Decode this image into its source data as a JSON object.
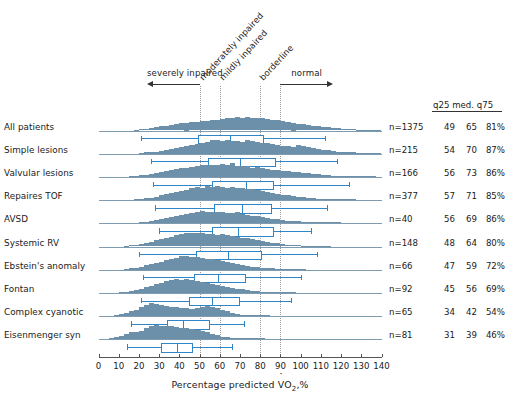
{
  "chart_data": {
    "type": "bar",
    "title": "",
    "xlabel": "Percentage predicted VO2,%",
    "xlabel_parts": {
      "pre": "Percentage predicted ",
      "v": "V",
      "o": "O",
      "sub": "2",
      "post": ",%"
    },
    "ylabel": "",
    "xlim": [
      0,
      140
    ],
    "xticks": [
      0,
      10,
      20,
      30,
      40,
      50,
      60,
      70,
      80,
      90,
      100,
      110,
      120,
      130,
      140
    ],
    "grid": true,
    "gridlines_x": [
      50,
      60,
      80,
      90
    ],
    "bin_width": 2.5,
    "legend_position": "none",
    "colors": {
      "histogram_fill": "#6d90aa",
      "baseline": "#7e9bb0",
      "boxwhisker": "#2e86c8",
      "gridline": "#9a9a9a",
      "axis": "#555555",
      "text": "#1a1a1a"
    },
    "annotations": [
      {
        "label": "severely inpaired",
        "kind": "arrow-left",
        "x_from": 50,
        "x_to": 24
      },
      {
        "label": "moderately inpaired",
        "kind": "rotated",
        "x": 50
      },
      {
        "label": "mildly inpaired",
        "kind": "rotated",
        "x": 60
      },
      {
        "label": "borderline",
        "kind": "rotated",
        "x": 80
      },
      {
        "label": "normal",
        "kind": "arrow-right",
        "x_from": 90,
        "x_to": 116
      }
    ],
    "stats_header": {
      "q25": "q25",
      "med": "med.",
      "q75": "q75"
    },
    "series": [
      {
        "name": "All patients",
        "n_label": "n=1375",
        "q25": "49",
        "med": "65",
        "q75": "81%",
        "box": {
          "lo": 21,
          "q1": 49,
          "med": 65,
          "q3": 81,
          "hi": 112
        },
        "values": [
          0,
          0,
          0,
          0,
          0,
          0,
          0,
          0.06,
          0.08,
          0.1,
          0.14,
          0.2,
          0.26,
          0.3,
          0.34,
          0.4,
          0.46,
          0.5,
          0.52,
          0.56,
          0.6,
          0.62,
          0.66,
          0.7,
          0.76,
          0.82,
          0.78,
          0.84,
          0.8,
          0.86,
          0.82,
          0.8,
          0.78,
          0.74,
          0.7,
          0.66,
          0.6,
          0.56,
          0.5,
          0.44,
          0.4,
          0.34,
          0.3,
          0.26,
          0.22,
          0.2,
          0.16,
          0.14,
          0.12,
          0.1,
          0.08,
          0.06,
          0.05,
          0.04,
          0.03,
          0.02
        ]
      },
      {
        "name": "Simple lesions",
        "n_label": "n=215",
        "q25": "54",
        "med": "70",
        "q75": "87%",
        "box": {
          "lo": 26,
          "q1": 54,
          "med": 70,
          "q3": 87,
          "hi": 118
        },
        "values": [
          0,
          0,
          0,
          0,
          0,
          0,
          0,
          0,
          0.06,
          0.08,
          0.1,
          0.12,
          0.18,
          0.22,
          0.3,
          0.36,
          0.42,
          0.5,
          0.54,
          0.62,
          0.7,
          0.76,
          0.86,
          0.9,
          0.84,
          0.88,
          0.8,
          0.82,
          0.78,
          0.86,
          0.8,
          0.76,
          0.7,
          0.68,
          0.6,
          0.56,
          0.52,
          0.5,
          0.46,
          0.56,
          0.5,
          0.42,
          0.36,
          0.3,
          0.26,
          0.22,
          0.18,
          0.14,
          0.12,
          0.1,
          0.08,
          0.06,
          0.05,
          0.04,
          0.02,
          0.02
        ]
      },
      {
        "name": "Valvular lesions",
        "n_label": "n=166",
        "q25": "56",
        "med": "73",
        "q75": "86%",
        "box": {
          "lo": 27,
          "q1": 56,
          "med": 73,
          "q3": 86,
          "hi": 124
        },
        "values": [
          0,
          0,
          0,
          0,
          0,
          0,
          0.04,
          0.06,
          0.1,
          0.14,
          0.2,
          0.26,
          0.3,
          0.36,
          0.42,
          0.5,
          0.56,
          0.6,
          0.66,
          0.7,
          0.78,
          0.74,
          0.8,
          0.76,
          0.82,
          0.78,
          0.9,
          0.72,
          0.7,
          0.68,
          0.6,
          0.62,
          0.58,
          0.5,
          0.46,
          0.44,
          0.4,
          0.36,
          0.32,
          0.3,
          0.26,
          0.22,
          0.2,
          0.16,
          0.12,
          0.1,
          0.08,
          0.06,
          0.05,
          0.04,
          0.03,
          0.02,
          0.02,
          0.02,
          0.01,
          0
        ]
      },
      {
        "name": "Repaires TOF",
        "n_label": "n=377",
        "q25": "57",
        "med": "71",
        "q75": "85%",
        "box": {
          "lo": 28,
          "q1": 57,
          "med": 71,
          "q3": 85,
          "hi": 113
        },
        "values": [
          0,
          0,
          0,
          0,
          0,
          0,
          0,
          0.06,
          0.08,
          0.12,
          0.16,
          0.22,
          0.3,
          0.38,
          0.44,
          0.52,
          0.6,
          0.68,
          0.76,
          0.84,
          0.8,
          0.88,
          0.82,
          0.9,
          0.86,
          0.8,
          0.84,
          0.78,
          0.8,
          0.74,
          0.7,
          0.66,
          0.6,
          0.54,
          0.48,
          0.42,
          0.36,
          0.3,
          0.26,
          0.22,
          0.18,
          0.14,
          0.12,
          0.1,
          0.08,
          0.06,
          0.04,
          0.03,
          0.02,
          0.02,
          0.01,
          0,
          0,
          0,
          0,
          0
        ]
      },
      {
        "name": "AVSD",
        "n_label": "n=40",
        "q25": "56",
        "med": "69",
        "q75": "86%",
        "box": {
          "lo": 30,
          "q1": 56,
          "med": 69,
          "q3": 86,
          "hi": 105
        },
        "values": [
          0,
          0,
          0,
          0,
          0,
          0,
          0,
          0,
          0.06,
          0.1,
          0.14,
          0.2,
          0.26,
          0.34,
          0.4,
          0.46,
          0.54,
          0.6,
          0.66,
          0.72,
          0.78,
          0.74,
          0.7,
          0.76,
          0.72,
          0.68,
          0.64,
          0.7,
          0.6,
          0.56,
          0.5,
          0.46,
          0.4,
          0.36,
          0.3,
          0.26,
          0.22,
          0.18,
          0.14,
          0.12,
          0.1,
          0.08,
          0.06,
          0.04,
          0.03,
          0.02,
          0.02,
          0.01,
          0,
          0,
          0,
          0,
          0,
          0,
          0,
          0
        ]
      },
      {
        "name": "Systemic RV",
        "n_label": "n=148",
        "q25": "48",
        "med": "64",
        "q75": "80%",
        "box": {
          "lo": 20,
          "q1": 48,
          "med": 64,
          "q3": 80,
          "hi": 108
        },
        "values": [
          0,
          0,
          0,
          0,
          0,
          0.04,
          0.08,
          0.12,
          0.18,
          0.24,
          0.32,
          0.4,
          0.48,
          0.56,
          0.64,
          0.72,
          0.8,
          0.86,
          0.9,
          0.84,
          0.88,
          0.8,
          0.82,
          0.76,
          0.78,
          0.72,
          0.68,
          0.64,
          0.58,
          0.52,
          0.46,
          0.4,
          0.34,
          0.3,
          0.24,
          0.2,
          0.16,
          0.12,
          0.1,
          0.08,
          0.06,
          0.04,
          0.03,
          0.02,
          0.02,
          0.01,
          0,
          0,
          0,
          0,
          0,
          0,
          0,
          0,
          0,
          0
        ]
      },
      {
        "name": "Ebstein's anomaly",
        "n_label": "n=66",
        "q25": "47",
        "med": "59",
        "q75": "72%",
        "box": {
          "lo": 22,
          "q1": 47,
          "med": 59,
          "q3": 72,
          "hi": 100
        },
        "values": [
          0,
          0,
          0,
          0,
          0,
          0.04,
          0.08,
          0.14,
          0.2,
          0.28,
          0.36,
          0.44,
          0.52,
          0.62,
          0.7,
          0.78,
          0.86,
          0.9,
          0.84,
          0.8,
          0.76,
          0.72,
          0.66,
          0.6,
          0.54,
          0.48,
          0.42,
          0.36,
          0.3,
          0.26,
          0.2,
          0.16,
          0.12,
          0.1,
          0.08,
          0.06,
          0.04,
          0.03,
          0.02,
          0.02,
          0.01,
          0,
          0,
          0,
          0,
          0,
          0,
          0,
          0,
          0,
          0,
          0,
          0,
          0,
          0,
          0
        ]
      },
      {
        "name": "Fontan",
        "n_label": "n=92",
        "q25": "45",
        "med": "56",
        "q75": "69%",
        "box": {
          "lo": 21,
          "q1": 45,
          "med": 56,
          "q3": 69,
          "hi": 95
        },
        "values": [
          0,
          0,
          0,
          0,
          0.04,
          0.08,
          0.14,
          0.2,
          0.28,
          0.36,
          0.46,
          0.56,
          0.64,
          0.74,
          0.82,
          0.88,
          0.84,
          0.9,
          0.82,
          0.78,
          0.72,
          0.66,
          0.6,
          0.52,
          0.46,
          0.4,
          0.34,
          0.28,
          0.24,
          0.18,
          0.14,
          0.1,
          0.08,
          0.06,
          0.04,
          0.03,
          0.02,
          0.02,
          0.01,
          0,
          0,
          0,
          0,
          0,
          0,
          0,
          0,
          0,
          0,
          0,
          0,
          0,
          0,
          0,
          0,
          0
        ]
      },
      {
        "name": "Complex cyanotic",
        "n_label": "n=65",
        "q25": "34",
        "med": "42",
        "q75": "54%",
        "box": {
          "lo": 16,
          "q1": 34,
          "med": 42,
          "q3": 54,
          "hi": 72
        },
        "values": [
          0,
          0,
          0,
          0.06,
          0.12,
          0.2,
          0.3,
          0.42,
          0.56,
          0.7,
          0.86,
          0.78,
          0.7,
          0.64,
          0.6,
          0.56,
          0.52,
          0.5,
          0.48,
          0.52,
          0.6,
          0.66,
          0.6,
          0.5,
          0.4,
          0.3,
          0.22,
          0.16,
          0.1,
          0.06,
          0.04,
          0.02,
          0.02,
          0.01,
          0,
          0,
          0,
          0,
          0,
          0,
          0,
          0,
          0,
          0,
          0,
          0,
          0,
          0,
          0,
          0,
          0,
          0,
          0,
          0,
          0,
          0
        ]
      },
      {
        "name": "Eisenmenger syn",
        "n_label": "n=81",
        "q25": "31",
        "med": "39",
        "q75": "46%",
        "box": {
          "lo": 14,
          "q1": 31,
          "med": 39,
          "q3": 46,
          "hi": 66
        },
        "values": [
          0,
          0,
          0.06,
          0.14,
          0.24,
          0.36,
          0.44,
          0.5,
          0.56,
          0.72,
          0.86,
          0.9,
          0.88,
          0.86,
          0.84,
          0.8,
          0.76,
          0.7,
          0.66,
          0.6,
          0.54,
          0.46,
          0.36,
          0.26,
          0.18,
          0.12,
          0.08,
          0.06,
          0.04,
          0.03,
          0.02,
          0.02,
          0.01,
          0,
          0,
          0,
          0,
          0,
          0,
          0,
          0,
          0,
          0,
          0,
          0,
          0,
          0,
          0,
          0,
          0,
          0,
          0,
          0,
          0,
          0,
          0
        ]
      }
    ]
  }
}
